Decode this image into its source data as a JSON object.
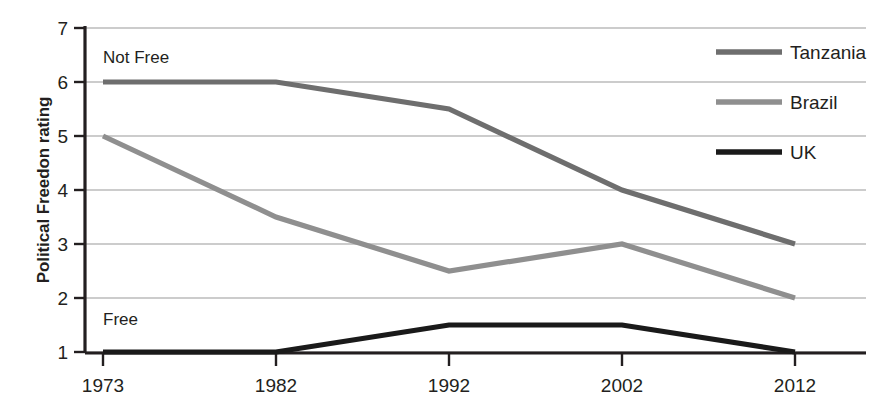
{
  "chart_data": {
    "type": "line",
    "title": "",
    "xlabel": "",
    "ylabel": "Political Freedon rating",
    "x": [
      1973,
      1982,
      1992,
      2002,
      2012
    ],
    "xticklabels": [
      "1973",
      "1982",
      "1992",
      "2002",
      "2012"
    ],
    "yticklabels": [
      "1",
      "2",
      "3",
      "4",
      "5",
      "6",
      "7"
    ],
    "ylim": [
      1,
      7
    ],
    "ytick_values": [
      1,
      2,
      3,
      4,
      5,
      6,
      7
    ],
    "grid": "horizontal",
    "legend_position": "right",
    "series": [
      {
        "name": "Tanzania",
        "values": [
          6,
          6,
          5.5,
          4,
          3
        ],
        "color": "#6e6e6e"
      },
      {
        "name": "Brazil",
        "values": [
          5,
          3.5,
          2.5,
          3,
          2
        ],
        "color": "#8f8f8f"
      },
      {
        "name": "UK",
        "values": [
          1,
          1,
          1.5,
          1.5,
          1
        ],
        "color": "#1a1a1a"
      }
    ],
    "annotations": [
      {
        "text": "Not Free",
        "x": 1973,
        "y": 6.55
      },
      {
        "text": "Free",
        "x": 1973,
        "y": 1.5
      }
    ]
  },
  "axes": {
    "y_title": "Political Freedon rating"
  },
  "legend": {
    "items": [
      {
        "label": "Tanzania",
        "color": "#6e6e6e"
      },
      {
        "label": "Brazil",
        "color": "#8f8f8f"
      },
      {
        "label": "UK",
        "color": "#1a1a1a"
      }
    ]
  },
  "annotations": {
    "not_free": "Not Free",
    "free": "Free"
  },
  "ticks": {
    "y": [
      "7",
      "6",
      "5",
      "4",
      "3",
      "2",
      "1"
    ],
    "x": [
      "1973",
      "1982",
      "1992",
      "2002",
      "2012"
    ]
  },
  "colors": {
    "axis": "#231f20",
    "gridline": "#9a9a9a",
    "background": "#ffffff"
  }
}
